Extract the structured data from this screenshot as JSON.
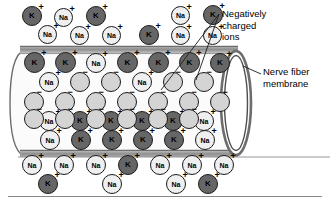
{
  "figure": {
    "type": "biology-diagram"
  },
  "labels": [
    {
      "name": "negatively-charged-ions-label",
      "lines": [
        "Negatively",
        "charged",
        "ions"
      ],
      "text": "Negatively\ncharged\nions",
      "x": 222,
      "y": 8
    },
    {
      "name": "nerve-fiber-membrane-label",
      "lines": [
        "Nerve fiber",
        "membrane"
      ],
      "text": "Nerve fiber\nmembrane",
      "x": 263,
      "y": 66
    }
  ],
  "colors": {
    "potassium_fill": "#666666",
    "sodium_fill": "#efefef",
    "negative_ion_fill": "#d4d4d4",
    "outline": "#1b1b1b",
    "membrane_band": "#9a9a9a",
    "membrane_band_light": "#c9c9c9",
    "interior": "#fbfbfb",
    "background": "#ffffff",
    "rule": "#888888"
  },
  "ion_types": {
    "K": {
      "label": "K",
      "charge": "+",
      "name": "potassium-ion"
    },
    "Na": {
      "label": "Na",
      "charge": "+",
      "name": "sodium-ion"
    },
    "NEG": {
      "label": "",
      "charge": "−",
      "name": "negative-ion"
    }
  },
  "membrane": {
    "top_band_y": 46,
    "bottom_band_y": 152,
    "band_height": 8,
    "left_cap_x": 8,
    "right_end_x": 250,
    "ellipse_rx": 14,
    "ellipse_ry": 48
  },
  "ions": [
    {
      "t": "K",
      "x": 22,
      "y": 6,
      "d": 20
    },
    {
      "t": "Na",
      "x": 54,
      "y": 8,
      "d": 19
    },
    {
      "t": "K",
      "x": 86,
      "y": 6,
      "d": 20
    },
    {
      "t": "Na",
      "x": 171,
      "y": 6,
      "d": 19
    },
    {
      "t": "K",
      "x": 203,
      "y": 5,
      "d": 20
    },
    {
      "t": "Na",
      "x": 38,
      "y": 25,
      "d": 19
    },
    {
      "t": "Na",
      "x": 70,
      "y": 26,
      "d": 19
    },
    {
      "t": "Na",
      "x": 102,
      "y": 26,
      "d": 19
    },
    {
      "t": "K",
      "x": 139,
      "y": 25,
      "d": 20
    },
    {
      "t": "Na",
      "x": 171,
      "y": 26,
      "d": 19
    },
    {
      "t": "Na",
      "x": 203,
      "y": 26,
      "d": 19
    },
    {
      "t": "K",
      "x": 24,
      "y": 52,
      "d": 21
    },
    {
      "t": "K",
      "x": 55,
      "y": 52,
      "d": 21
    },
    {
      "t": "Na",
      "x": 86,
      "y": 53,
      "d": 20
    },
    {
      "t": "K",
      "x": 117,
      "y": 52,
      "d": 21
    },
    {
      "t": "K",
      "x": 148,
      "y": 52,
      "d": 21
    },
    {
      "t": "K",
      "x": 179,
      "y": 52,
      "d": 21
    },
    {
      "t": "K",
      "x": 210,
      "y": 53,
      "d": 20
    },
    {
      "t": "Na",
      "x": 39,
      "y": 72,
      "d": 20
    },
    {
      "t": "NEG",
      "x": 70,
      "y": 72,
      "d": 20
    },
    {
      "t": "NEG",
      "x": 101,
      "y": 72,
      "d": 20
    },
    {
      "t": "Na",
      "x": 132,
      "y": 72,
      "d": 20
    },
    {
      "t": "NEG",
      "x": 163,
      "y": 72,
      "d": 20
    },
    {
      "t": "NEG",
      "x": 194,
      "y": 72,
      "d": 20
    },
    {
      "t": "NEG",
      "x": 24,
      "y": 92,
      "d": 20
    },
    {
      "t": "NEG",
      "x": 55,
      "y": 92,
      "d": 20
    },
    {
      "t": "NEG",
      "x": 86,
      "y": 92,
      "d": 20
    },
    {
      "t": "NEG",
      "x": 117,
      "y": 92,
      "d": 20
    },
    {
      "t": "NEG",
      "x": 148,
      "y": 92,
      "d": 20
    },
    {
      "t": "NEG",
      "x": 179,
      "y": 92,
      "d": 20
    },
    {
      "t": "NEG",
      "x": 210,
      "y": 92,
      "d": 20
    },
    {
      "t": "Na",
      "x": 39,
      "y": 111,
      "d": 20
    },
    {
      "t": "K",
      "x": 70,
      "y": 111,
      "d": 20
    },
    {
      "t": "K",
      "x": 101,
      "y": 111,
      "d": 20
    },
    {
      "t": "K",
      "x": 132,
      "y": 111,
      "d": 20
    },
    {
      "t": "K",
      "x": 163,
      "y": 111,
      "d": 20
    },
    {
      "t": "Na",
      "x": 194,
      "y": 111,
      "d": 20
    },
    {
      "t": "NEG",
      "x": 24,
      "y": 109,
      "d": 20
    },
    {
      "t": "NEG",
      "x": 55,
      "y": 109,
      "d": 20
    },
    {
      "t": "NEG",
      "x": 86,
      "y": 109,
      "d": 20
    },
    {
      "t": "NEG",
      "x": 117,
      "y": 109,
      "d": 20
    },
    {
      "t": "NEG",
      "x": 148,
      "y": 109,
      "d": 20
    },
    {
      "t": "NEG",
      "x": 179,
      "y": 109,
      "d": 20
    },
    {
      "t": "Na",
      "x": 40,
      "y": 130,
      "d": 20
    },
    {
      "t": "K",
      "x": 71,
      "y": 130,
      "d": 20
    },
    {
      "t": "K",
      "x": 102,
      "y": 130,
      "d": 20
    },
    {
      "t": "K",
      "x": 133,
      "y": 130,
      "d": 20
    },
    {
      "t": "K",
      "x": 164,
      "y": 130,
      "d": 20
    },
    {
      "t": "Na",
      "x": 195,
      "y": 130,
      "d": 20
    },
    {
      "t": "Na",
      "x": 22,
      "y": 155,
      "d": 20
    },
    {
      "t": "Na",
      "x": 54,
      "y": 155,
      "d": 20
    },
    {
      "t": "Na",
      "x": 86,
      "y": 155,
      "d": 20
    },
    {
      "t": "K",
      "x": 118,
      "y": 155,
      "d": 20
    },
    {
      "t": "Na",
      "x": 150,
      "y": 155,
      "d": 20
    },
    {
      "t": "Na",
      "x": 182,
      "y": 155,
      "d": 20
    },
    {
      "t": "Na",
      "x": 214,
      "y": 155,
      "d": 20
    },
    {
      "t": "K",
      "x": 38,
      "y": 174,
      "d": 20
    },
    {
      "t": "Na",
      "x": 102,
      "y": 174,
      "d": 20
    },
    {
      "t": "Na",
      "x": 166,
      "y": 174,
      "d": 20
    },
    {
      "t": "K",
      "x": 198,
      "y": 174,
      "d": 20
    }
  ],
  "leader_lines": [
    {
      "name": "leader-negative-ions-1",
      "x1": 219,
      "y1": 14,
      "x2": 161,
      "y2": 90
    },
    {
      "name": "leader-negative-ions-2",
      "x1": 219,
      "y1": 14,
      "x2": 196,
      "y2": 80
    },
    {
      "name": "leader-nerve-fiber-membrane",
      "x1": 261,
      "y1": 74,
      "x2": 243,
      "y2": 66
    }
  ]
}
